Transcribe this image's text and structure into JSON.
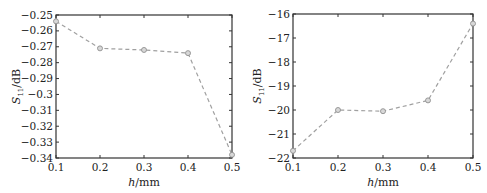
{
  "chart_data": [
    {
      "type": "line",
      "title": "",
      "xlabel": "h/mm",
      "ylabel": "S11/dB",
      "xlabel_parts": {
        "var": "h",
        "unit": "/mm"
      },
      "ylabel_parts": {
        "var": "S",
        "sub": "11",
        "unit": "/dB"
      },
      "x": [
        0.1,
        0.2,
        0.3,
        0.4,
        0.5
      ],
      "series": [
        {
          "name": "S11",
          "values": [
            -0.254,
            -0.271,
            -0.272,
            -0.274,
            -0.338
          ],
          "style": "dashed",
          "marker": "circle",
          "color": "#a0a0a0"
        }
      ],
      "xlim": [
        0.1,
        0.5
      ],
      "ylim": [
        -0.34,
        -0.25
      ],
      "xticks": [
        0.1,
        0.2,
        0.3,
        0.4,
        0.5
      ],
      "xtick_labels": [
        "0.1",
        "0.2",
        "0.3",
        "0.4",
        "0.5"
      ],
      "yticks": [
        -0.25,
        -0.26,
        -0.27,
        -0.28,
        -0.29,
        -0.3,
        -0.31,
        -0.32,
        -0.33,
        -0.34
      ],
      "ytick_labels": [
        "−0.25",
        "−0.26",
        "−0.27",
        "−0.28",
        "−0.29",
        "−0.3",
        "−0.31",
        "−0.32",
        "−0.33",
        "−0.34"
      ],
      "grid": false,
      "legend": null
    },
    {
      "type": "line",
      "title": "",
      "xlabel": "h/mm",
      "ylabel": "S11/dB",
      "xlabel_parts": {
        "var": "h",
        "unit": "/mm"
      },
      "ylabel_parts": {
        "var": "S",
        "sub": "11",
        "unit": "/dB"
      },
      "x": [
        0.1,
        0.2,
        0.3,
        0.4,
        0.5
      ],
      "series": [
        {
          "name": "S11",
          "values": [
            -21.7,
            -20.0,
            -20.05,
            -19.6,
            -16.4
          ],
          "style": "dashed",
          "marker": "circle",
          "color": "#a0a0a0"
        }
      ],
      "xlim": [
        0.1,
        0.5
      ],
      "ylim": [
        -22,
        -16
      ],
      "xticks": [
        0.1,
        0.2,
        0.3,
        0.4,
        0.5
      ],
      "xtick_labels": [
        "0.1",
        "0.2",
        "0.3",
        "0.4",
        "0.5"
      ],
      "yticks": [
        -16,
        -17,
        -18,
        -19,
        -20,
        -21,
        -22
      ],
      "ytick_labels": [
        "−16",
        "−17",
        "−18",
        "−19",
        "−20",
        "−21",
        "−22"
      ],
      "grid": false,
      "legend": null
    }
  ]
}
